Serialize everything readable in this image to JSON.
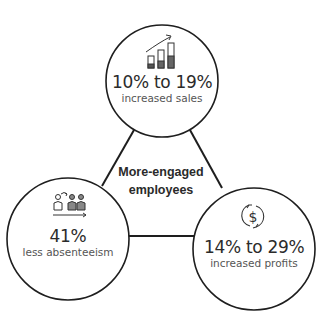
{
  "diagram": {
    "center": {
      "line1": "More-engaged",
      "line2": "employees"
    },
    "nodes": [
      {
        "id": "sales",
        "icon": "bar-chart-growth-icon",
        "value": "10% to 19%",
        "label": "increased sales"
      },
      {
        "id": "absenteeism",
        "icon": "people-attendance-icon",
        "value": "41%",
        "label": "less absenteeism"
      },
      {
        "id": "profits",
        "icon": "dollar-cycle-icon",
        "value": "14% to 29%",
        "label": "increased profits"
      }
    ],
    "colors": {
      "stroke": "#1e1e1e",
      "background": "#ffffff",
      "text": "#2b2b2b"
    }
  }
}
